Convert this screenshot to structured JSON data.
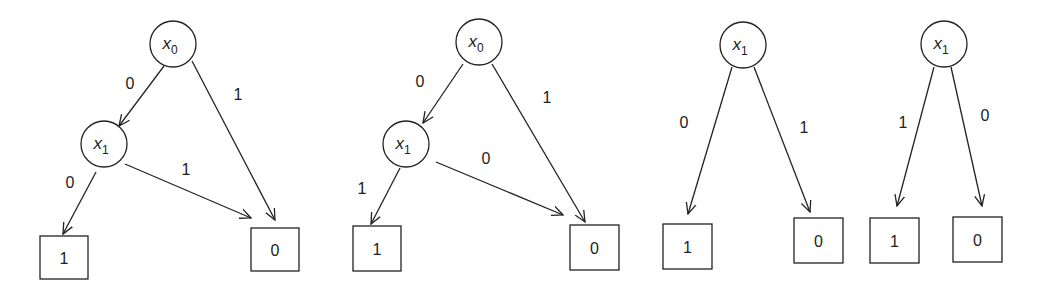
{
  "diagrams": [
    {
      "name": "bdd-1",
      "nodes": [
        {
          "id": "a",
          "type": "var",
          "var": "x",
          "sub": "0",
          "cx": 173,
          "cy": 44
        },
        {
          "id": "b",
          "type": "var",
          "var": "x",
          "sub": "1",
          "cx": 104,
          "cy": 144
        },
        {
          "id": "c",
          "type": "terminal",
          "value": "1",
          "x": 40,
          "y": 236,
          "w": 48,
          "h": 43
        },
        {
          "id": "d",
          "type": "terminal",
          "value": "0",
          "x": 251,
          "y": 228,
          "w": 48,
          "h": 43
        }
      ],
      "edges": [
        {
          "from": [
            164,
            66
          ],
          "to": [
            119,
            126
          ],
          "label": "0",
          "lx": 130,
          "ly": 89
        },
        {
          "from": [
            192,
            61
          ],
          "to": [
            275,
            220
          ],
          "label": "1",
          "lx": 238,
          "ly": 100
        },
        {
          "from": [
            96,
            172
          ],
          "to": [
            63,
            234
          ],
          "label": "0",
          "lx": 70,
          "ly": 188
        },
        {
          "from": [
            125,
            164
          ],
          "to": [
            251,
            218
          ],
          "label": "1",
          "lx": 186,
          "ly": 175
        }
      ]
    },
    {
      "name": "bdd-2",
      "nodes": [
        {
          "id": "a",
          "type": "var",
          "var": "x",
          "sub": "0",
          "cx": 479,
          "cy": 42
        },
        {
          "id": "b",
          "type": "var",
          "var": "x",
          "sub": "1",
          "cx": 406,
          "cy": 144
        },
        {
          "id": "c",
          "type": "terminal",
          "value": "1",
          "x": 353,
          "y": 226,
          "w": 48,
          "h": 45
        },
        {
          "id": "d",
          "type": "terminal",
          "value": "0",
          "x": 570,
          "y": 225,
          "w": 49,
          "h": 45
        }
      ],
      "edges": [
        {
          "from": [
            463,
            64
          ],
          "to": [
            423,
            123
          ],
          "label": "0",
          "lx": 420,
          "ly": 87
        },
        {
          "from": [
            492,
            64
          ],
          "to": [
            585,
            222
          ],
          "label": "1",
          "lx": 547,
          "ly": 103
        },
        {
          "from": [
            400,
            168
          ],
          "to": [
            371,
            224
          ],
          "label": "1",
          "lx": 362,
          "ly": 194
        },
        {
          "from": [
            436,
            162
          ],
          "to": [
            563,
            215
          ],
          "label": "0",
          "lx": 486,
          "ly": 164
        }
      ]
    },
    {
      "name": "bdd-3",
      "nodes": [
        {
          "id": "a",
          "type": "var",
          "var": "x",
          "sub": "1",
          "cx": 743,
          "cy": 45
        },
        {
          "id": "c",
          "type": "terminal",
          "value": "1",
          "x": 663,
          "y": 224,
          "w": 49,
          "h": 45
        },
        {
          "id": "d",
          "type": "terminal",
          "value": "0",
          "x": 794,
          "y": 218,
          "w": 49,
          "h": 45
        }
      ],
      "edges": [
        {
          "from": [
            732,
            67
          ],
          "to": [
            688,
            214
          ],
          "label": "0",
          "lx": 684,
          "ly": 128
        },
        {
          "from": [
            754,
            67
          ],
          "to": [
            810,
            212
          ],
          "label": "1",
          "lx": 804,
          "ly": 133
        }
      ]
    },
    {
      "name": "bdd-4",
      "nodes": [
        {
          "id": "a",
          "type": "var",
          "var": "x",
          "sub": "1",
          "cx": 944,
          "cy": 44
        },
        {
          "id": "c",
          "type": "terminal",
          "value": "1",
          "x": 870,
          "y": 218,
          "w": 49,
          "h": 45
        },
        {
          "id": "d",
          "type": "terminal",
          "value": "0",
          "x": 953,
          "y": 217,
          "w": 49,
          "h": 45
        }
      ],
      "edges": [
        {
          "from": [
            934,
            67
          ],
          "to": [
            897,
            206
          ],
          "label": "1",
          "lx": 903,
          "ly": 128
        },
        {
          "from": [
            951,
            67
          ],
          "to": [
            982,
            206
          ],
          "label": "0",
          "lx": 985,
          "ly": 121
        }
      ]
    }
  ],
  "style": {
    "stroke": "#222222",
    "background": "#ffffff",
    "circle_radius": 23
  }
}
